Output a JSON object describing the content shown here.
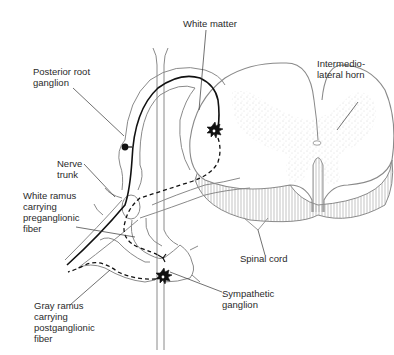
{
  "labels": {
    "white_matter": "White matter",
    "posterior_root_ganglion_1": "Posterior root",
    "posterior_root_ganglion_2": "ganglion",
    "intermediolateral_horn_1": "Intermedio-",
    "intermediolateral_horn_2": "lateral horn",
    "nerve_trunk_1": "Nerve",
    "nerve_trunk_2": "trunk",
    "white_ramus_1": "White ramus",
    "white_ramus_2": "carrying",
    "white_ramus_3": "preganglionic",
    "white_ramus_4": "fiber",
    "spinal_cord": "Spinal cord",
    "gray_ramus_1": "Gray ramus",
    "gray_ramus_2": "carrying",
    "gray_ramus_3": "postganglionic",
    "gray_ramus_4": "fiber",
    "sympathetic_ganglion_1": "Sympathetic",
    "sympathetic_ganglion_2": "ganglion"
  },
  "legend": {
    "solid_line": "afferent (sensory) fiber",
    "dashed_line": "efferent (preganglionic / postganglionic) fiber"
  },
  "colors": {
    "outline": "#8a8a8a",
    "fiber": "#111111",
    "stipple": "#9a9a9a",
    "text": "#2a2a2a"
  }
}
